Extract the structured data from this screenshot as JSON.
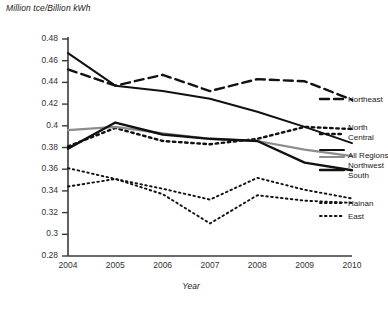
{
  "chart_data": {
    "type": "line",
    "title": "",
    "subtitle": "",
    "ylabel": "Million tce/Billion kWh",
    "xlabel": "Year",
    "x": [
      2004,
      2005,
      2006,
      2007,
      2008,
      2009,
      2010
    ],
    "xtick_labels": [
      "2004",
      "2005",
      "2006",
      "2007",
      "2008",
      "2009",
      "2010"
    ],
    "ytick_labels": [
      "0.48",
      "0.46",
      "0.44",
      "0.42",
      "0.4",
      "0.38",
      "0.36",
      "0.34",
      "0.32",
      "0.3",
      "0.28"
    ],
    "ytick_values": [
      0.48,
      0.46,
      0.44,
      0.42,
      0.4,
      0.38,
      0.36,
      0.34,
      0.32,
      0.3,
      0.28
    ],
    "ylim": [
      0.28,
      0.48
    ],
    "xlim": [
      2004,
      2010
    ],
    "grid": false,
    "legend_position": "right-inline",
    "series": [
      {
        "name": "Northeast",
        "style": "dashed",
        "color": "#111111",
        "width": 2.4,
        "values": [
          0.452,
          0.437,
          0.447,
          0.432,
          0.443,
          0.441,
          0.424
        ]
      },
      {
        "name": "Northwest",
        "style": "solid",
        "color": "#111111",
        "width": 2.0,
        "values": [
          0.467,
          0.437,
          0.432,
          0.425,
          0.413,
          0.399,
          0.384
        ]
      },
      {
        "name": "North Central",
        "style": "dotted-coarse",
        "color": "#111111",
        "width": 2.4,
        "values": [
          0.381,
          0.398,
          0.386,
          0.383,
          0.388,
          0.399,
          0.397
        ]
      },
      {
        "name": "All Regions",
        "style": "solid",
        "color": "#8d8d8d",
        "width": 2.2,
        "values": [
          0.396,
          0.399,
          0.393,
          0.388,
          0.386,
          0.378,
          0.372
        ]
      },
      {
        "name": "South",
        "style": "solid",
        "color": "#111111",
        "width": 2.4,
        "values": [
          0.379,
          0.403,
          0.392,
          0.388,
          0.386,
          0.366,
          0.359
        ]
      },
      {
        "name": "Hainan",
        "style": "dotted-fine",
        "color": "#111111",
        "width": 1.9,
        "values": [
          0.361,
          0.351,
          0.342,
          0.332,
          0.352,
          0.341,
          0.333
        ]
      },
      {
        "name": "East",
        "style": "dotted-fine",
        "color": "#111111",
        "width": 1.9,
        "values": [
          0.344,
          0.351,
          0.337,
          0.31,
          0.336,
          0.331,
          0.329
        ]
      }
    ],
    "legend_entries": [
      {
        "label": "Northeast",
        "style": "dashed",
        "color": "#111111"
      },
      {
        "label": "North",
        "style": "dotted-coarse",
        "color": "#111111"
      },
      {
        "label": "Central",
        "style": "continuation",
        "color": "#111111"
      },
      {
        "label": "All Regions",
        "style": "solid",
        "color": "#8d8d8d"
      },
      {
        "label": "Northwest",
        "style": "solid",
        "color": "#111111"
      },
      {
        "label": "South",
        "style": "solid",
        "color": "#111111"
      },
      {
        "label": "Hainan",
        "style": "dotted-fine",
        "color": "#111111"
      },
      {
        "label": "East",
        "style": "dotted-fine",
        "color": "#111111"
      }
    ]
  },
  "caption": ""
}
